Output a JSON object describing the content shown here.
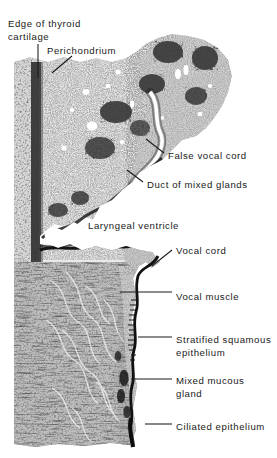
{
  "figure": {
    "kind": "histology-micrograph-plate",
    "background_color": "#ffffff",
    "ink_color": "#1a1a1a",
    "tissue_tone_dark": "#2b2b2b",
    "tissue_tone_mid": "#777777",
    "tissue_tone_light": "#cfcfcf"
  },
  "labels": [
    {
      "id": "edge-of-thyroid-cartilage",
      "line1": "Edge of thyroid",
      "line2": "cartilage",
      "x": 8,
      "y": 18
    },
    {
      "id": "perichondrium",
      "line1": "Perichondrium",
      "line2": "",
      "x": 47,
      "y": 45
    },
    {
      "id": "false-vocal-cord",
      "line1": "False vocal cord",
      "line2": "",
      "x": 168,
      "y": 150
    },
    {
      "id": "duct-of-mixed-glands",
      "line1": "Duct of mixed glands",
      "line2": "",
      "x": 147,
      "y": 179
    },
    {
      "id": "laryngeal-ventricle",
      "line1": "Laryngeal ventricle",
      "line2": "",
      "x": 88,
      "y": 220
    },
    {
      "id": "vocal-cord",
      "line1": "Vocal cord",
      "line2": "",
      "x": 176,
      "y": 245
    },
    {
      "id": "vocal-muscle",
      "line1": "Vocal muscle",
      "line2": "",
      "x": 176,
      "y": 291
    },
    {
      "id": "stratified-squamous-epithelium",
      "line1": "Stratified squamous",
      "line2": "epithelium",
      "x": 176,
      "y": 334
    },
    {
      "id": "mixed-mucous-gland",
      "line1": "Mixed mucous",
      "line2": "gland",
      "x": 176,
      "y": 375
    },
    {
      "id": "ciliated-epithelium",
      "line1": "Ciliated epithelium",
      "line2": "",
      "x": 176,
      "y": 421
    }
  ],
  "leaders": [
    {
      "id": "leader-edge-of-thyroid-cartilage",
      "points": "38,44 38,78"
    },
    {
      "id": "leader-perichondrium",
      "points": "72,56 52,73"
    },
    {
      "id": "leader-false-vocal-cord",
      "points": "164,153 146,139"
    },
    {
      "id": "leader-duct-of-mixed-glands",
      "points": "143,182 127,170"
    },
    {
      "id": "leader-vocal-cord",
      "points": "172,250 152,266"
    },
    {
      "id": "leader-vocal-muscle",
      "points": "172,292 120,292"
    },
    {
      "id": "leader-stratified-squamous-epithelium",
      "points": "172,337 138,337"
    },
    {
      "id": "leader-mixed-mucous-gland",
      "points": "172,379 131,379"
    },
    {
      "id": "leader-ciliated-epithelium",
      "points": "172,424 145,424"
    }
  ]
}
